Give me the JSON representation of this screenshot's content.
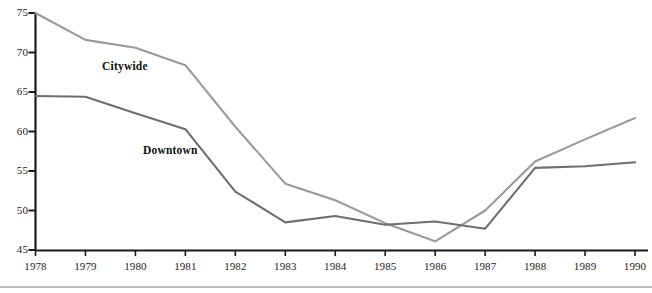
{
  "chart_data": {
    "type": "line",
    "title": "",
    "xlabel": "",
    "ylabel": "",
    "categories": [
      "1978",
      "1979",
      "1980",
      "1981",
      "1982",
      "1983",
      "1984",
      "1985",
      "1986",
      "1987",
      "1988",
      "1989",
      "1990"
    ],
    "x": [
      1978,
      1979,
      1980,
      1981,
      1982,
      1983,
      1984,
      1985,
      1986,
      1987,
      1988,
      1989,
      1990
    ],
    "ylim": [
      45,
      75
    ],
    "xlim": [
      1978,
      1990
    ],
    "yticks": [
      45,
      50,
      55,
      60,
      65,
      70,
      75
    ],
    "ytick_labels": [
      "45",
      "50",
      "55",
      "60",
      "65",
      "70",
      "75"
    ],
    "grid": false,
    "legend_position": "inline-annotation",
    "series": [
      {
        "name": "Citywide",
        "color": "#9a9a9a",
        "values": [
          75.0,
          71.6,
          70.6,
          68.4,
          60.6,
          53.4,
          51.3,
          48.4,
          46.1,
          50.0,
          56.2,
          59.0,
          61.7
        ]
      },
      {
        "name": "Downtown",
        "color": "#6e6e6e",
        "values": [
          64.5,
          64.4,
          62.3,
          60.3,
          52.4,
          48.5,
          49.3,
          48.2,
          48.6,
          47.7,
          55.4,
          55.6,
          56.1
        ]
      }
    ],
    "annotations": [
      {
        "text": "Citywide",
        "x_px": 102,
        "y_px": 60
      },
      {
        "text": "Downtown",
        "x_px": 143,
        "y_px": 144
      }
    ]
  },
  "axes": {
    "y_tick_labels": [
      "75",
      "70",
      "65",
      "60",
      "55",
      "50",
      "45"
    ],
    "x_tick_labels": [
      "1978",
      "1979",
      "1980",
      "1981",
      "1982",
      "1983",
      "1984",
      "1985",
      "1986",
      "1987",
      "1988",
      "1989",
      "1990"
    ]
  },
  "colors": {
    "citywide_line": "#9a9a9a",
    "downtown_line": "#6e6e6e",
    "axis": "#1b1b1b",
    "bottom_rule": "#bdbdbd",
    "background": "#ffffff"
  }
}
